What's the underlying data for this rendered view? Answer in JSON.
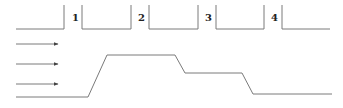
{
  "diagram": {
    "type": "flow-profile",
    "line_color": "#7a7a7a",
    "label_color": "#222222",
    "top_segments": [
      {
        "id": "seg-0",
        "x1": 16,
        "x2": 64,
        "left_wall": false,
        "right_wall": true
      },
      {
        "id": "seg-1",
        "x1": 82,
        "x2": 131,
        "left_wall": true,
        "right_wall": true
      },
      {
        "id": "seg-2",
        "x1": 149,
        "x2": 198,
        "left_wall": true,
        "right_wall": true
      },
      {
        "id": "seg-3",
        "x1": 216,
        "x2": 264,
        "left_wall": true,
        "right_wall": true
      },
      {
        "id": "seg-4",
        "x1": 282,
        "x2": 330,
        "left_wall": true,
        "right_wall": false
      }
    ],
    "labels": [
      {
        "text": "1",
        "x": 73,
        "y": 21
      },
      {
        "text": "2",
        "x": 139,
        "y": 21
      },
      {
        "text": "3",
        "x": 206,
        "y": 21
      },
      {
        "text": "4",
        "x": 272,
        "y": 21
      }
    ],
    "arrows": [
      {
        "x1": 16,
        "x2": 58,
        "y": 44
      },
      {
        "x1": 16,
        "x2": 58,
        "y": 64
      },
      {
        "x1": 16,
        "x2": 58,
        "y": 84
      }
    ],
    "profile_points": [
      [
        16,
        97
      ],
      [
        88,
        97
      ],
      [
        107,
        55
      ],
      [
        175,
        55
      ],
      [
        185,
        73
      ],
      [
        242,
        73
      ],
      [
        253,
        94
      ],
      [
        332,
        94
      ]
    ]
  }
}
